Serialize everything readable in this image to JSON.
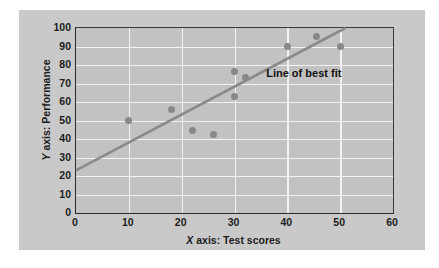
{
  "chart_data": {
    "type": "scatter",
    "title": "",
    "xlabel": "X axis: Test scores",
    "xlabel_italic_prefix": "X",
    "xlabel_rest": " axis: Test scores",
    "ylabel": "Y axis: Performance",
    "ylabel_italic_prefix": "Y",
    "ylabel_rest": " axis: Performance",
    "xlim": [
      0,
      60
    ],
    "ylim": [
      0,
      100
    ],
    "xticks": [
      0,
      10,
      20,
      30,
      40,
      50,
      60
    ],
    "yticks": [
      0,
      10,
      20,
      30,
      40,
      50,
      60,
      70,
      80,
      90,
      100
    ],
    "grid": true,
    "grid_color": "#f2f2f2",
    "legend": "none",
    "points": [
      {
        "x": 10,
        "y": 50
      },
      {
        "x": 18,
        "y": 56
      },
      {
        "x": 22,
        "y": 44.5
      },
      {
        "x": 26,
        "y": 42.5
      },
      {
        "x": 30,
        "y": 76.5
      },
      {
        "x": 30,
        "y": 63
      },
      {
        "x": 32,
        "y": 73.5
      },
      {
        "x": 40,
        "y": 90
      },
      {
        "x": 45.5,
        "y": 95.5
      },
      {
        "x": 50,
        "y": 90
      }
    ],
    "point_color": "#888888",
    "trendline": {
      "label": "Line of best fit",
      "color": "#8a8a8a",
      "x1": 0,
      "y1": 23,
      "x2": 51,
      "y2": 100
    },
    "background_color": "#c9c9c9",
    "plot_background_color": "#c2c2c2",
    "axis_color": "#2a2a2a"
  }
}
